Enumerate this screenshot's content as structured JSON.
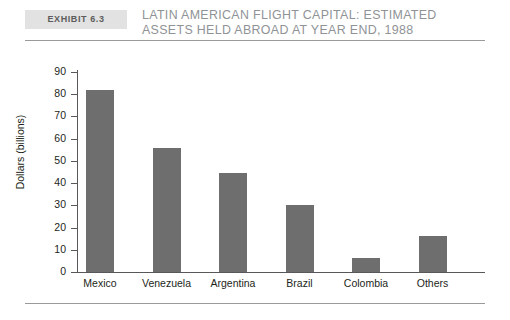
{
  "exhibit": {
    "badge_label": "Exhibit 6.3",
    "title": "Latin American Flight Capital: Estimated Assets Held Abroad at Year End, 1988"
  },
  "chart_data": {
    "type": "bar",
    "title": "Latin American Flight Capital: Estimated Assets Held Abroad at Year End, 1988",
    "categories": [
      "Mexico",
      "Venezuela",
      "Argentina",
      "Brazil",
      "Colombia",
      "Others"
    ],
    "values": [
      82,
      56,
      44.5,
      30,
      6.5,
      16
    ],
    "xlabel": "",
    "ylabel": "Dollars (billions)",
    "ylim": [
      0,
      90
    ],
    "ytick_step": 10,
    "yticks": [
      0,
      10,
      20,
      30,
      40,
      50,
      60,
      70,
      80,
      90
    ],
    "ytick_labels": [
      "0",
      "10",
      "20",
      "30",
      "40",
      "50",
      "60",
      "70",
      "80",
      "90"
    ],
    "grid": false,
    "legend": false,
    "bar_color": "#6e6e6e",
    "axis_color": "#58585a"
  }
}
